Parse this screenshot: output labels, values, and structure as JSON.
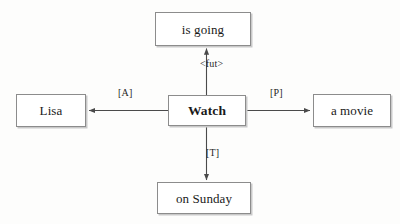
{
  "diagram": {
    "type": "semantic-role-dependency-graph",
    "background_color": "#fdfdfc",
    "border_color": "#8c8c8c",
    "text_color": "#1a1a1a",
    "center": {
      "label": "Watch",
      "bold": true
    },
    "nodes": [
      {
        "id": "predicate",
        "label": "is going",
        "position": "top"
      },
      {
        "id": "agent",
        "label": "Lisa",
        "position": "left"
      },
      {
        "id": "center",
        "label": "Watch",
        "position": "center"
      },
      {
        "id": "patient",
        "label": "a movie",
        "position": "right"
      },
      {
        "id": "time",
        "label": "on Sunday",
        "position": "bottom"
      }
    ],
    "edges": [
      {
        "id": "edge-fut",
        "label": "<fut>",
        "from": "center",
        "to": "predicate",
        "direction": "up"
      },
      {
        "id": "edge-a",
        "label": "[A]",
        "from": "center",
        "to": "agent",
        "direction": "left"
      },
      {
        "id": "edge-p",
        "label": "[P]",
        "from": "center",
        "to": "patient",
        "direction": "right"
      },
      {
        "id": "edge-t",
        "label": "[T]",
        "from": "center",
        "to": "time",
        "direction": "down"
      }
    ]
  }
}
